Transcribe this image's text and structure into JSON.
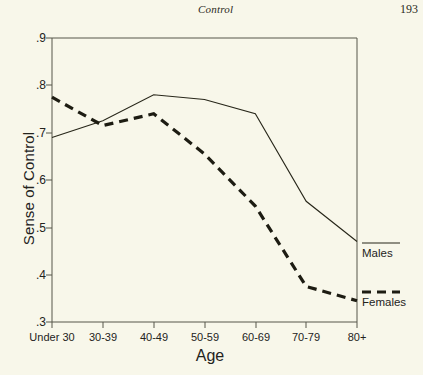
{
  "header": {
    "running_head": "Control",
    "page_number": "193"
  },
  "chart_data": {
    "type": "line",
    "title": "",
    "xlabel": "Age",
    "ylabel": "Sense of Control",
    "categories": [
      "Under 30",
      "30-39",
      "40-49",
      "50-59",
      "60-69",
      "70-79",
      "80+"
    ],
    "series": [
      {
        "name": "Males",
        "style": "solid",
        "values": [
          0.69,
          0.725,
          0.78,
          0.77,
          0.74,
          0.555,
          0.47
        ]
      },
      {
        "name": "Females",
        "style": "dashed",
        "values": [
          0.775,
          0.715,
          0.74,
          0.655,
          0.545,
          0.375,
          0.345
        ]
      }
    ],
    "ylim": [
      0.3,
      0.9
    ],
    "yticks": [
      0.9,
      0.8,
      0.7,
      0.6,
      0.5,
      0.4,
      0.3
    ],
    "ytick_labels": [
      ".9",
      ".8",
      ".7",
      ".6",
      ".5",
      ".4",
      ".3"
    ],
    "grid": false,
    "legend_position": "right",
    "line_color": "#272619",
    "background_color": "#f8f7ea"
  }
}
